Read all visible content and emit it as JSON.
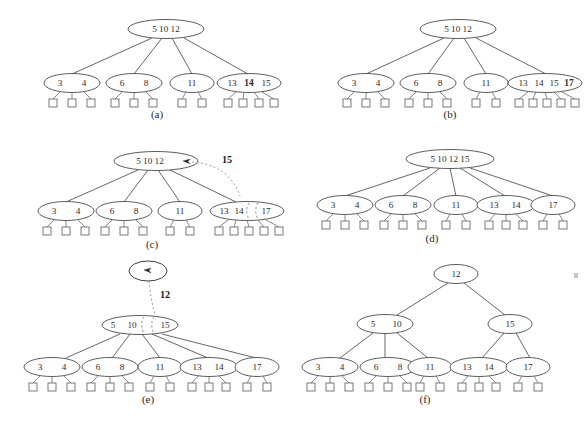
{
  "figure": {
    "panel_count": 6,
    "grid": "2 columns x 3 rows",
    "background_color": "#ffffff",
    "node_stroke_color": "#4a4a4a",
    "leaf_stroke_color": "#6b6b6b",
    "dashed_color": "#8a8a8a",
    "text_color": "#2c2c2c"
  },
  "panels": [
    {
      "id": "a",
      "label": "(a)",
      "caption_label": "(a)",
      "levels": 2,
      "root": {
        "keys": "5 10 12",
        "bold_keys": [],
        "empty": false
      },
      "children": [
        {
          "keys": "3  4",
          "bold_keys": [],
          "leaves": 3
        },
        {
          "keys": "6  8",
          "bold_keys": [],
          "leaves": 3
        },
        {
          "keys": "11",
          "bold_keys": [],
          "leaves": 2
        },
        {
          "keys": "13 14 15",
          "bold_keys": [
            "14"
          ],
          "leaves": 4
        }
      ],
      "annotation": null
    },
    {
      "id": "b",
      "label": "(b)",
      "caption_label": "(b)",
      "levels": 2,
      "root": {
        "keys": "5 10 12",
        "bold_keys": [],
        "empty": false
      },
      "children": [
        {
          "keys": "3  4",
          "bold_keys": [],
          "leaves": 3
        },
        {
          "keys": "6  8",
          "bold_keys": [],
          "leaves": 3
        },
        {
          "keys": "11",
          "bold_keys": [],
          "leaves": 2
        },
        {
          "keys": "13 14 15 17",
          "bold_keys": [
            "17"
          ],
          "leaves": 5
        }
      ],
      "annotation": null
    },
    {
      "id": "c",
      "label": "(c)",
      "caption_label": "(c)",
      "levels": 2,
      "root": {
        "keys": "5 10 12",
        "bold_keys": [],
        "empty": false,
        "has_pointer_slot": true
      },
      "children": [
        {
          "keys": "3  4",
          "bold_keys": [],
          "leaves": 3
        },
        {
          "keys": "6  8",
          "bold_keys": [],
          "leaves": 3
        },
        {
          "keys": "11",
          "bold_keys": [],
          "leaves": 2
        },
        {
          "keys": "13 14 | 17",
          "bold_keys": [],
          "leaves": 5,
          "splitting": true
        }
      ],
      "annotation": {
        "value": "15",
        "kind": "promoted-key",
        "style": "bold"
      }
    },
    {
      "id": "d",
      "label": "(d)",
      "caption_label": "(d)",
      "levels": 2,
      "root": {
        "keys": "5 10 12 15",
        "bold_keys": [],
        "empty": false
      },
      "children": [
        {
          "keys": "3  4",
          "bold_keys": [],
          "leaves": 3
        },
        {
          "keys": "6  8",
          "bold_keys": [],
          "leaves": 3
        },
        {
          "keys": "11",
          "bold_keys": [],
          "leaves": 2
        },
        {
          "keys": "13 14",
          "bold_keys": [],
          "leaves": 3
        },
        {
          "keys": "17",
          "bold_keys": [],
          "leaves": 2
        }
      ],
      "annotation": null
    },
    {
      "id": "e",
      "label": "(e)",
      "caption_label": "(e)",
      "levels": 3,
      "root": {
        "keys": "",
        "bold_keys": [],
        "empty": true,
        "has_pointer_slot": true
      },
      "middle": {
        "keys": "5  10 | 15",
        "bold_keys": [],
        "splitting": true
      },
      "children": [
        {
          "keys": "3  4",
          "bold_keys": [],
          "leaves": 3
        },
        {
          "keys": "6  8",
          "bold_keys": [],
          "leaves": 3
        },
        {
          "keys": "11",
          "bold_keys": [],
          "leaves": 2
        },
        {
          "keys": "13 14",
          "bold_keys": [],
          "leaves": 3
        },
        {
          "keys": "17",
          "bold_keys": [],
          "leaves": 2
        }
      ],
      "annotation": {
        "value": "12",
        "kind": "promoted-key",
        "style": "bold"
      }
    },
    {
      "id": "f",
      "label": "(f)",
      "caption_label": "(f)",
      "levels": 3,
      "root": {
        "keys": "12",
        "bold_keys": [],
        "empty": false
      },
      "internal": [
        {
          "keys": "5  10",
          "bold_keys": []
        },
        {
          "keys": "15",
          "bold_keys": []
        }
      ],
      "children": [
        {
          "keys": "3  4",
          "bold_keys": [],
          "leaves": 3,
          "parent": 0
        },
        {
          "keys": "6  8",
          "bold_keys": [],
          "leaves": 3,
          "parent": 0
        },
        {
          "keys": "11",
          "bold_keys": [],
          "leaves": 2,
          "parent": 0
        },
        {
          "keys": "13 14",
          "bold_keys": [],
          "leaves": 3,
          "parent": 1
        },
        {
          "keys": "17",
          "bold_keys": [],
          "leaves": 2,
          "parent": 1
        }
      ],
      "annotation": null
    }
  ],
  "text_values": {
    "panel_a_root": "5 10 12",
    "panel_a_c1": "3",
    "panel_a_c1b": "4",
    "panel_a_c2": "6",
    "panel_a_c2b": "8",
    "panel_a_c3": "11",
    "panel_a_c4_1": "13",
    "panel_a_c4_2": "14",
    "panel_a_c4_3": "15",
    "panel_a_label": "(a)",
    "panel_b_root": "5 10 12",
    "panel_b_c1": "3",
    "panel_b_c1b": "4",
    "panel_b_c2": "6",
    "panel_b_c2b": "8",
    "panel_b_c3": "11",
    "panel_b_c4_1": "13",
    "panel_b_c4_2": "14",
    "panel_b_c4_3": "15",
    "panel_b_c4_4": "17",
    "panel_b_label": "(b)",
    "panel_c_root": "5 10 12",
    "panel_c_c1": "3",
    "panel_c_c1b": "4",
    "panel_c_c2": "6",
    "panel_c_c2b": "8",
    "panel_c_c3": "11",
    "panel_c_c4_1": "13",
    "panel_c_c4_2": "14",
    "panel_c_c4_3": "17",
    "panel_c_promote": "15",
    "panel_c_label": "(c)",
    "panel_d_root": "5 10 12 15",
    "panel_d_c1": "3",
    "panel_d_c1b": "4",
    "panel_d_c2": "6",
    "panel_d_c2b": "8",
    "panel_d_c3": "11",
    "panel_d_c4_1": "13",
    "panel_d_c4_2": "14",
    "panel_d_c5": "17",
    "panel_d_label": "(d)",
    "panel_e_mid_1": "5",
    "panel_e_mid_2": "10",
    "panel_e_mid_3": "15",
    "panel_e_c1": "3",
    "panel_e_c1b": "4",
    "panel_e_c2": "6",
    "panel_e_c2b": "8",
    "panel_e_c3": "11",
    "panel_e_c4_1": "13",
    "panel_e_c4_2": "14",
    "panel_e_c5": "17",
    "panel_e_promote": "12",
    "panel_e_label": "(e)",
    "panel_f_root": "12",
    "panel_f_i1": "5",
    "panel_f_i1b": "10",
    "panel_f_i2": "15",
    "panel_f_c1": "3",
    "panel_f_c1b": "4",
    "panel_f_c2": "6",
    "panel_f_c2b": "8",
    "panel_f_c3": "11",
    "panel_f_c4_1": "13",
    "panel_f_c4_2": "14",
    "panel_f_c5": "17",
    "panel_f_label": "(f)"
  }
}
